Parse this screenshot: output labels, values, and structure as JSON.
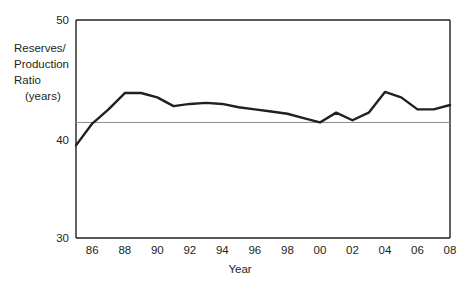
{
  "chart_data": {
    "type": "line",
    "title": "",
    "xlabel": "Year",
    "ylabel": "Reserves/\nProduction\nRatio\n(years)",
    "ylabel_lines": [
      "Reserves/",
      "Production",
      "Ratio",
      "(years)"
    ],
    "xlim": [
      1985,
      2008
    ],
    "ylim": [
      30,
      50
    ],
    "ytick_labels": [
      "50",
      "40",
      "30"
    ],
    "yticks": [
      50,
      40,
      30
    ],
    "xtick_labels": [
      "86",
      "88",
      "90",
      "92",
      "94",
      "96",
      "98",
      "00",
      "02",
      "04",
      "06",
      "08"
    ],
    "xticks": [
      1986,
      1988,
      1990,
      1992,
      1994,
      1996,
      1998,
      2000,
      2002,
      2004,
      2006,
      2008
    ],
    "grid": "single horizontal reference line at 40.6",
    "reference_line_value": 40.6,
    "legend": "none",
    "legend_position": "none",
    "line_color": "#231f20",
    "reference_line_color": "#8c8c8c",
    "axis_color": "#231f20",
    "background_color": "#ffffff",
    "x": [
      1985,
      1986,
      1987,
      1988,
      1989,
      1990,
      1991,
      1992,
      1993,
      1994,
      1995,
      1996,
      1997,
      1998,
      1999,
      2000,
      2001,
      2002,
      2003,
      2004,
      2005,
      2006,
      2007,
      2008
    ],
    "values": [
      38.5,
      40.5,
      41.8,
      43.3,
      43.3,
      42.9,
      42.1,
      42.3,
      42.4,
      42.3,
      42.0,
      41.8,
      41.6,
      41.4,
      41.0,
      40.6,
      41.5,
      40.8,
      41.5,
      43.4,
      42.9,
      41.8,
      41.8,
      42.2
    ],
    "series": [
      {
        "name": "Reserves/Production Ratio",
        "values": [
          38.5,
          40.5,
          41.8,
          43.3,
          43.3,
          42.9,
          42.1,
          42.3,
          42.4,
          42.3,
          42.0,
          41.8,
          41.6,
          41.4,
          41.0,
          40.6,
          41.5,
          40.8,
          41.5,
          43.4,
          42.9,
          41.8,
          41.8,
          42.2
        ]
      }
    ]
  }
}
